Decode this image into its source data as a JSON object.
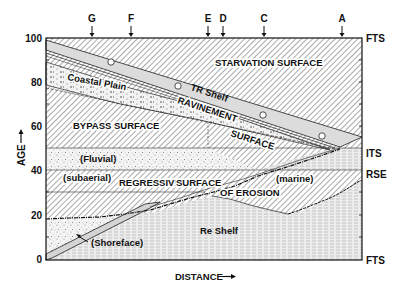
{
  "figure": {
    "y_axis": {
      "label": "AGE",
      "arrow": "up",
      "ticks": [
        "0",
        "20",
        "40",
        "60",
        "80",
        "100"
      ]
    },
    "x_axis": {
      "label": "DISTANCE",
      "arrow": "right"
    },
    "top_markers": [
      "G",
      "F",
      "E",
      "D",
      "C",
      "A"
    ],
    "right_labels": {
      "fts_top": "FTS",
      "its": "ITS",
      "rse": "RSE",
      "fts_bottom": "FTS"
    },
    "regions": {
      "starvation": "STARVATION SURFACE",
      "tr_shelf": "TR Shelf",
      "coastal_plain": "Coastal Plain",
      "ravinement": "RAVINEMENT",
      "ravinement_surface": "SURFACE",
      "bypass": "BYPASS SURFACE",
      "fluvial": "(Fluvial)",
      "subaerial": "(subaerial)",
      "regressive": "REGRESSIVE",
      "regressive_surface": "SURFACE",
      "of_erosion": "OF EROSION",
      "marine": "(marine)",
      "re_shelf": "Re Shelf",
      "shoreface": "(Shoreface)"
    },
    "fossil_symbol": "e"
  }
}
